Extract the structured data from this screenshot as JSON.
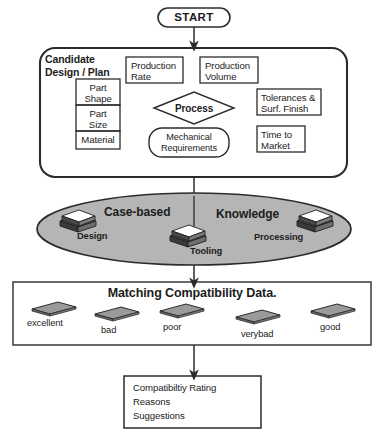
{
  "diagram": {
    "start_node": {
      "label": "START"
    },
    "candidate_block": {
      "title_line1": "Candidate",
      "title_line2": "Design / Plan",
      "part_attributes": [
        {
          "line1": "Part",
          "line2": "Shape"
        },
        {
          "line1": "Part",
          "line2": "Size"
        },
        {
          "line1": "Material",
          "line2": ""
        }
      ],
      "factor_boxes": [
        {
          "line1": "Production",
          "line2": "Rate"
        },
        {
          "line1": "Production",
          "line2": "Volume"
        },
        {
          "line1": "Tolerances &",
          "line2": "Surf. Finish"
        },
        {
          "line1": "Time to",
          "line2": "Market"
        }
      ],
      "process_node": {
        "label": "Process"
      },
      "mechanical_node": {
        "line1": "Mechanical",
        "line2": "Requirements"
      }
    },
    "knowledge_ellipse": {
      "heading_left": "Case-based",
      "heading_right": "Knowledge",
      "sources": [
        {
          "label": "Design"
        },
        {
          "label": "Tooling"
        },
        {
          "label": "Processing"
        }
      ]
    },
    "matching_block": {
      "heading": "Matching Compatibility Data.",
      "ratings": [
        {
          "label": "excellent"
        },
        {
          "label": "bad"
        },
        {
          "label": "poor"
        },
        {
          "label": "verybad"
        },
        {
          "label": "good"
        }
      ]
    },
    "output_block": {
      "lines": [
        "Compatibiltiy Rating",
        "Reasons",
        "Suggestions"
      ]
    },
    "colors": {
      "stroke": "#2b2b2b",
      "ellipse_fill": "#b5b5b5",
      "plate_fill": "#8f8f8f",
      "background": "#ffffff"
    }
  }
}
